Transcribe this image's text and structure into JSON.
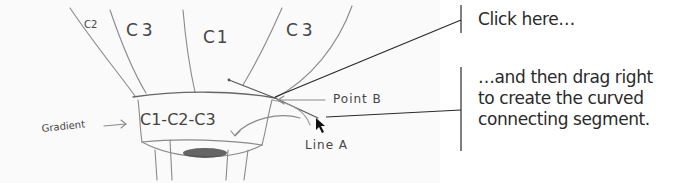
{
  "sketch": {
    "panel_labels": [
      "C2",
      "C3",
      "C1",
      "C3"
    ],
    "band_label": "C1-C2-C3",
    "gradient_label": "Gradient",
    "point_label": "Point B",
    "line_label": "Line A"
  },
  "callouts": [
    {
      "text": "Click here…"
    },
    {
      "lines": [
        "…and then drag right",
        "to create the curved",
        "connecting segment."
      ]
    }
  ],
  "colors": {
    "pencil": "#8a8a8a",
    "pencil_dark": "#555555",
    "callout_line": "#2a2a2a",
    "text": "#2a2a2a"
  }
}
